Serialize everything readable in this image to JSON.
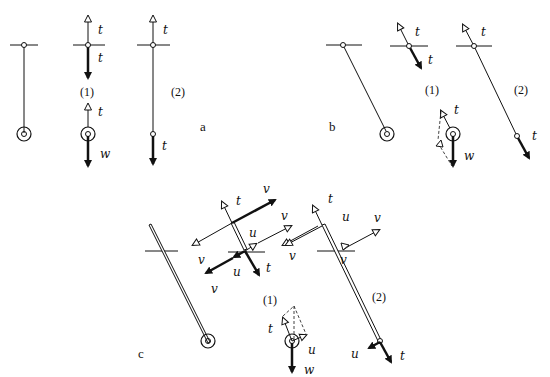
{
  "figure": {
    "panels": [
      {
        "id": "a",
        "label": "a",
        "sub_labels": [
          "(1)",
          "(2)"
        ],
        "description": "Vertical pendulum at rest: full system, free body of rod/bob (1), and extended string (2)"
      },
      {
        "id": "b",
        "label": "b",
        "sub_labels": [
          "(1)",
          "(2)"
        ],
        "description": "Pendulum displaced at an angle: force decomposition with tension and weight"
      },
      {
        "id": "c",
        "label": "c",
        "sub_labels": [
          "(1)",
          "(2)"
        ],
        "description": "Rigid rod pendulum: forces t, u, v at pivot and bob"
      }
    ],
    "force_labels": {
      "tension": "t",
      "weight": "w",
      "shear": "u",
      "pivot_force": "v"
    },
    "colors": {
      "ink": "#111111",
      "background": "#ffffff"
    }
  }
}
